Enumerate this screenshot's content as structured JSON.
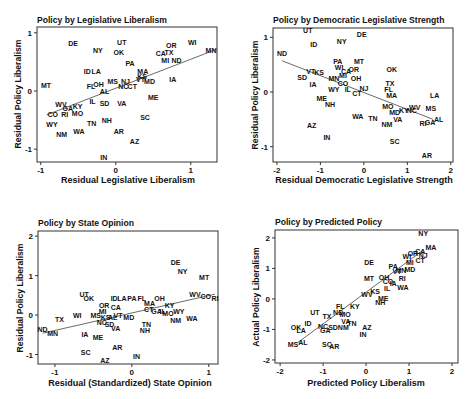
{
  "chart_data": [
    {
      "type": "scatter",
      "title": "Policy by Legislative Liberalism",
      "xlabel": "Residual Legislative Liberalism",
      "ylabel": "Residual Policy Liberalism",
      "xlim": [
        -1.05,
        1.35
      ],
      "ylim": [
        -1.22,
        1.1
      ],
      "xticks": [
        -1,
        0,
        1
      ],
      "yticks": [
        -1,
        0,
        1
      ],
      "grid": false,
      "legend": null,
      "fit_line": [
        [
          -0.92,
          -0.41
        ],
        [
          1.35,
          0.72
        ]
      ],
      "points": [
        [
          "DE",
          -0.57,
          0.81
        ],
        [
          "NY",
          -0.24,
          0.69
        ],
        [
          "UT",
          0.08,
          0.83
        ],
        [
          "OK",
          0.04,
          0.67
        ],
        [
          "OR",
          0.74,
          0.78
        ],
        [
          "WI",
          1.02,
          0.83
        ],
        [
          "MN",
          1.27,
          0.69
        ],
        [
          "CA",
          0.6,
          0.64
        ],
        [
          "TX",
          0.71,
          0.67
        ],
        [
          "MI",
          0.66,
          0.52
        ],
        [
          "ND",
          0.81,
          0.52
        ],
        [
          "PA",
          0.19,
          0.48
        ],
        [
          "ID",
          -0.38,
          0.34
        ],
        [
          "LA",
          -0.26,
          0.34
        ],
        [
          "MA",
          0.36,
          0.34
        ],
        [
          "KS",
          0.35,
          0.25
        ],
        [
          "VT",
          0.33,
          0.19
        ],
        [
          "MD",
          0.45,
          0.17
        ],
        [
          "IA",
          0.76,
          0.19
        ],
        [
          "MT",
          -0.93,
          0.09
        ],
        [
          "FL",
          -0.33,
          0.07
        ],
        [
          "OH",
          -0.23,
          0.12
        ],
        [
          "MS",
          -0.04,
          0.17
        ],
        [
          "NJ",
          0.13,
          0.17
        ],
        [
          "NC",
          0.1,
          0.07
        ],
        [
          "CT",
          0.22,
          0.07
        ],
        [
          "AL",
          -0.15,
          -0.01
        ],
        [
          "ME",
          0.5,
          -0.12
        ],
        [
          "WV",
          -0.73,
          -0.23
        ],
        [
          "GA",
          -0.64,
          -0.3
        ],
        [
          "KY",
          -0.51,
          -0.26
        ],
        [
          "IL",
          -0.31,
          -0.18
        ],
        [
          "SD",
          -0.15,
          -0.21
        ],
        [
          "VA",
          0.08,
          -0.21
        ],
        [
          "CO",
          -0.84,
          -0.4
        ],
        [
          "RI",
          -0.68,
          -0.41
        ],
        [
          "MO",
          -0.51,
          -0.38
        ],
        [
          "SC",
          0.39,
          -0.46
        ],
        [
          "WY",
          -0.85,
          -0.57
        ],
        [
          "TN",
          -0.32,
          -0.55
        ],
        [
          "NH",
          -0.12,
          -0.51
        ],
        [
          "NM",
          -0.72,
          -0.74
        ],
        [
          "WA",
          -0.49,
          -0.69
        ],
        [
          "AR",
          0.04,
          -0.7
        ],
        [
          "AZ",
          0.25,
          -0.86
        ],
        [
          "IN",
          -0.16,
          -1.14
        ]
      ]
    },
    {
      "type": "scatter",
      "title": "Policy by Democratic Legislative Strength",
      "xlabel": "Residual Democratic Legislative Strength",
      "ylabel": "Residual Policy Liberalism",
      "xlim": [
        -2.09,
        2.05
      ],
      "ylim": [
        -1.28,
        1.17
      ],
      "xticks": [
        -2,
        -1,
        0,
        1,
        2
      ],
      "yticks": [
        -1,
        0,
        1
      ],
      "grid": false,
      "legend": null,
      "fit_line": [
        [
          -1.88,
          0.57
        ],
        [
          1.59,
          -0.5
        ]
      ],
      "points": [
        [
          "UT",
          -1.29,
          1.12
        ],
        [
          "DE",
          -0.05,
          1.05
        ],
        [
          "NY",
          -0.51,
          0.92
        ],
        [
          "ID",
          -1.15,
          0.86
        ],
        [
          "ND",
          -1.88,
          0.71
        ],
        [
          "PA",
          -0.6,
          0.55
        ],
        [
          "MT",
          -0.11,
          0.55
        ],
        [
          "VT",
          -1.22,
          0.38
        ],
        [
          "KS",
          -1.03,
          0.36
        ],
        [
          "SD",
          -1.42,
          0.27
        ],
        [
          "WI",
          -0.57,
          0.44
        ],
        [
          "CA",
          -0.41,
          0.38
        ],
        [
          "OR",
          -0.23,
          0.42
        ],
        [
          "MI",
          -0.48,
          0.31
        ],
        [
          "MN",
          -0.69,
          0.24
        ],
        [
          "CO",
          -0.48,
          0.16
        ],
        [
          "OH",
          -0.18,
          0.24
        ],
        [
          "IA",
          -1.17,
          0.13
        ],
        [
          "WY",
          -0.69,
          0.04
        ],
        [
          "IL",
          -0.37,
          0.05
        ],
        [
          "CT",
          -0.16,
          -0.02
        ],
        [
          "NJ",
          0.0,
          0.07
        ],
        [
          "OK",
          0.64,
          0.42
        ],
        [
          "TX",
          0.6,
          0.15
        ],
        [
          "FL",
          0.57,
          0.05
        ],
        [
          "MA",
          0.64,
          -0.07
        ],
        [
          "LA",
          1.63,
          -0.07
        ],
        [
          "ME",
          -0.97,
          -0.11
        ],
        [
          "NH",
          -0.78,
          -0.22
        ],
        [
          "MO",
          0.55,
          -0.26
        ],
        [
          "MD",
          0.71,
          -0.37
        ],
        [
          "KY",
          0.92,
          -0.33
        ],
        [
          "NC",
          1.1,
          -0.33
        ],
        [
          "WV",
          1.17,
          -0.28
        ],
        [
          "MS",
          1.54,
          -0.31
        ],
        [
          "WA",
          -0.14,
          -0.44
        ],
        [
          "TN",
          0.21,
          -0.48
        ],
        [
          "NM",
          0.53,
          -0.59
        ],
        [
          "VA",
          0.78,
          -0.5
        ],
        [
          "RI",
          1.36,
          -0.57
        ],
        [
          "GA",
          1.52,
          -0.55
        ],
        [
          "AL",
          1.72,
          -0.5
        ],
        [
          "AZ",
          -1.2,
          -0.62
        ],
        [
          "IN",
          -0.85,
          -0.83
        ],
        [
          "SC",
          0.71,
          -0.9
        ],
        [
          "AR",
          1.45,
          -1.17
        ]
      ]
    },
    {
      "type": "scatter",
      "title": "Policy by State Opinion",
      "xlabel": "Residual (Standardized) State Opinion",
      "ylabel": "Residual Policy Liberalism",
      "xlim": [
        -1.22,
        1.12
      ],
      "ylim": [
        -1.24,
        2.13
      ],
      "xticks": [
        -1,
        0,
        1
      ],
      "yticks": [
        -1,
        0,
        1,
        2
      ],
      "grid": false,
      "legend": null,
      "fit_line": [
        [
          -1.16,
          -0.46
        ],
        [
          1.08,
          0.53
        ]
      ],
      "points": [
        [
          "DE",
          0.57,
          1.34
        ],
        [
          "NY",
          0.66,
          1.11
        ],
        [
          "MT",
          0.94,
          0.96
        ],
        [
          "UT",
          -0.62,
          0.51
        ],
        [
          "OK",
          -0.56,
          0.41
        ],
        [
          "ID",
          -0.23,
          0.43
        ],
        [
          "LA",
          -0.13,
          0.43
        ],
        [
          "PA",
          0.0,
          0.41
        ],
        [
          "FL",
          0.13,
          0.41
        ],
        [
          "OH",
          0.36,
          0.41
        ],
        [
          "MA",
          0.23,
          0.3
        ],
        [
          "KY",
          0.49,
          0.23
        ],
        [
          "CT",
          0.22,
          0.13
        ],
        [
          "GA",
          0.32,
          0.1
        ],
        [
          "IL",
          0.4,
          0.1
        ],
        [
          "WY",
          0.61,
          0.1
        ],
        [
          "MO",
          0.47,
          0.03
        ],
        [
          "NM",
          0.57,
          -0.15
        ],
        [
          "WA",
          0.78,
          -0.08
        ],
        [
          "WV",
          0.82,
          0.51
        ],
        [
          "CO",
          0.96,
          0.46
        ],
        [
          "RI",
          1.08,
          0.41
        ],
        [
          "OR",
          -0.36,
          0.23
        ],
        [
          "CA",
          -0.21,
          0.2
        ],
        [
          "MI",
          -0.38,
          0.08
        ],
        [
          "MS",
          -0.47,
          0.0
        ],
        [
          "KS",
          -0.34,
          -0.05
        ],
        [
          "AL",
          -0.25,
          -0.05
        ],
        [
          "VT",
          -0.18,
          0.0
        ],
        [
          "MD",
          -0.04,
          -0.05
        ],
        [
          "NC",
          -0.39,
          -0.2
        ],
        [
          "SD",
          -0.29,
          -0.23
        ],
        [
          "VA",
          -0.21,
          -0.33
        ],
        [
          "TX",
          -0.94,
          -0.1
        ],
        [
          "WI",
          -0.71,
          0.0
        ],
        [
          "ND",
          -1.16,
          -0.36
        ],
        [
          "MN",
          -1.03,
          -0.46
        ],
        [
          "IA",
          -0.61,
          -0.48
        ],
        [
          "ME",
          -0.44,
          -0.56
        ],
        [
          "TN",
          0.19,
          -0.23
        ],
        [
          "NH",
          0.17,
          -0.38
        ],
        [
          "AR",
          -0.19,
          -0.81
        ],
        [
          "SC",
          -0.6,
          -0.94
        ],
        [
          "IN",
          0.06,
          -1.04
        ],
        [
          "AZ",
          -0.35,
          -1.16
        ]
      ]
    },
    {
      "type": "scatter",
      "title": "Policy by Predicted Policy",
      "xlabel": "Predicted Policy Liberalism",
      "ylabel": "Actual Policy Liberalism",
      "xlim": [
        -2.12,
        2.14
      ],
      "ylim": [
        -2.1,
        2.26
      ],
      "xticks": [
        -2,
        -1,
        0,
        1,
        2
      ],
      "yticks": [
        -2,
        -1,
        0,
        1,
        2
      ],
      "grid": false,
      "legend": null,
      "fit_line": [
        [
          -1.6,
          -1.44
        ],
        [
          1.33,
          1.6
        ]
      ],
      "points": [
        [
          "NY",
          1.33,
          2.16
        ],
        [
          "MA",
          1.51,
          1.67
        ],
        [
          "CA",
          1.26,
          1.54
        ],
        [
          "OR",
          1.09,
          1.48
        ],
        [
          "WI",
          0.95,
          1.38
        ],
        [
          "NJ",
          1.33,
          1.44
        ],
        [
          "MI",
          1.02,
          1.21
        ],
        [
          "CT",
          1.26,
          1.25
        ],
        [
          "DE",
          0.07,
          1.18
        ],
        [
          "PA",
          0.63,
          1.05
        ],
        [
          "MD",
          1.02,
          0.95
        ],
        [
          "VT",
          0.72,
          0.89
        ],
        [
          "MN",
          0.81,
          0.92
        ],
        [
          "RI",
          0.84,
          0.66
        ],
        [
          "MT",
          0.07,
          0.66
        ],
        [
          "OH",
          0.42,
          0.69
        ],
        [
          "CO",
          0.51,
          0.56
        ],
        [
          "IA",
          0.63,
          0.52
        ],
        [
          "IL",
          0.49,
          0.33
        ],
        [
          "WA",
          0.86,
          0.36
        ],
        [
          "WV",
          0.02,
          0.16
        ],
        [
          "KS",
          0.21,
          0.26
        ],
        [
          "ME",
          0.4,
          0.03
        ],
        [
          "NH",
          0.33,
          -0.13
        ],
        [
          "UT",
          -1.19,
          -0.43
        ],
        [
          "FL",
          -0.6,
          -0.26
        ],
        [
          "KY",
          -0.26,
          -0.26
        ],
        [
          "TX",
          -0.91,
          -0.59
        ],
        [
          "ND",
          -0.65,
          -0.46
        ],
        [
          "MO",
          -0.49,
          -0.52
        ],
        [
          "VA",
          -0.47,
          -0.75
        ],
        [
          "TN",
          -0.33,
          -0.82
        ],
        [
          "NC",
          -1.0,
          -0.89
        ],
        [
          "GA",
          -0.95,
          -1.05
        ],
        [
          "SD",
          -0.77,
          -0.95
        ],
        [
          "NM",
          -0.53,
          -0.95
        ],
        [
          "OK",
          -1.63,
          -0.95
        ],
        [
          "LA",
          -1.51,
          -1.02
        ],
        [
          "ID",
          -1.35,
          -0.82
        ],
        [
          "AZ",
          0.02,
          -0.95
        ],
        [
          "IN",
          -0.07,
          -1.18
        ],
        [
          "MS",
          -1.7,
          -1.48
        ],
        [
          "AL",
          -1.47,
          -1.44
        ],
        [
          "SC",
          -0.91,
          -1.48
        ],
        [
          "AR",
          -0.74,
          -1.57
        ]
      ]
    }
  ]
}
